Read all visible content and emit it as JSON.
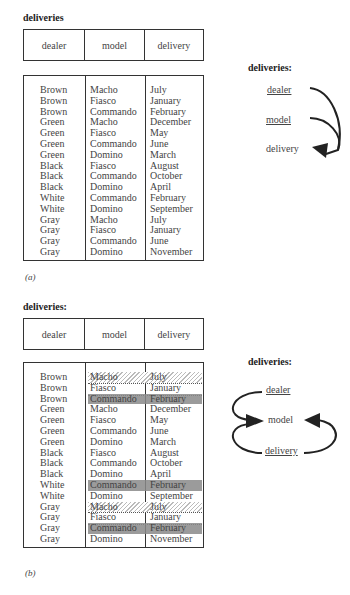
{
  "figure_a": {
    "title": "deliveries",
    "caption": "(a)",
    "columns": [
      "dealer",
      "model",
      "delivery"
    ],
    "rows": [
      [
        "Brown",
        "Macho",
        "July"
      ],
      [
        "Brown",
        "Fiasco",
        "January"
      ],
      [
        "Brown",
        "Commando",
        "February"
      ],
      [
        "Green",
        "Macho",
        "December"
      ],
      [
        "Green",
        "Fiasco",
        "May"
      ],
      [
        "Green",
        "Commando",
        "June"
      ],
      [
        "Green",
        "Domino",
        "March"
      ],
      [
        "Black",
        "Fiasco",
        "August"
      ],
      [
        "Black",
        "Commando",
        "October"
      ],
      [
        "Black",
        "Domino",
        "April"
      ],
      [
        "White",
        "Commando",
        "February"
      ],
      [
        "White",
        "Domino",
        "September"
      ],
      [
        "Gray",
        "Macho",
        "July"
      ],
      [
        "Gray",
        "Fiasco",
        "January"
      ],
      [
        "Gray",
        "Commando",
        "June"
      ],
      [
        "Gray",
        "Domino",
        "November"
      ]
    ],
    "diagram": {
      "title": "deliveries:",
      "nodes": [
        "dealer",
        "model",
        "delivery"
      ],
      "underlined": [
        "dealer",
        "model"
      ],
      "arrows": [
        {
          "from": "dealer",
          "to": "delivery"
        },
        {
          "from": "model",
          "to": "delivery"
        }
      ]
    }
  },
  "figure_b": {
    "title": "deliveries:",
    "caption": "(b)",
    "columns": [
      "dealer",
      "model",
      "delivery"
    ],
    "rows": [
      [
        "Brown",
        "Macho",
        "July"
      ],
      [
        "Brown",
        "Fiasco",
        "January"
      ],
      [
        "Brown",
        "Commando",
        "February"
      ],
      [
        "Green",
        "Macho",
        "December"
      ],
      [
        "Green",
        "Fiasco",
        "May"
      ],
      [
        "Green",
        "Commando",
        "June"
      ],
      [
        "Green",
        "Domino",
        "March"
      ],
      [
        "Black",
        "Fiasco",
        "August"
      ],
      [
        "Black",
        "Commando",
        "October"
      ],
      [
        "Black",
        "Domino",
        "April"
      ],
      [
        "White",
        "Commando",
        "February"
      ],
      [
        "White",
        "Domino",
        "September"
      ],
      [
        "Gray",
        "Macho",
        "July"
      ],
      [
        "Gray",
        "Fiasco",
        "January"
      ],
      [
        "Gray",
        "Commando",
        "February"
      ],
      [
        "Gray",
        "Domino",
        "November"
      ]
    ],
    "highlights": {
      "dark_rows": [
        2,
        10,
        14
      ],
      "hatched_rows": [
        0,
        12
      ],
      "dotted_rows": [
        1,
        13
      ]
    },
    "diagram": {
      "title": "deliveries:",
      "nodes": [
        "dealer",
        "model",
        "delivery"
      ],
      "underlined": [
        "dealer",
        "delivery"
      ],
      "arrows": [
        {
          "from": "dealer",
          "to": "model"
        },
        {
          "from": "delivery",
          "to": "model"
        },
        {
          "from": "delivery",
          "to": "model",
          "side": "right"
        }
      ]
    }
  }
}
